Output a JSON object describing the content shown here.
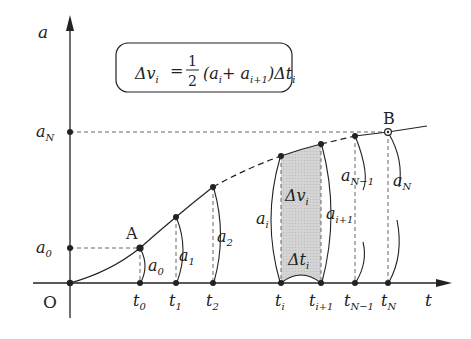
{
  "axes": {
    "y_label": "a",
    "x_label": "t",
    "origin_label": "O"
  },
  "formula": {
    "lhs": "Δv",
    "lhs_sub": "i",
    "equals": "=",
    "frac_num": "1",
    "frac_den": "2",
    "rhs_open": "(a",
    "rhs_sub1": "i",
    "rhs_plus": "+ a",
    "rhs_sub2": "i+1",
    "rhs_close": ")Δt",
    "rhs_sub3": "i"
  },
  "points": {
    "A": "A",
    "B": "B"
  },
  "y_ticks": [
    {
      "main": "a",
      "sub": "N"
    },
    {
      "main": "a",
      "sub": "0"
    }
  ],
  "x_ticks": [
    {
      "main": "t",
      "sub": "0"
    },
    {
      "main": "t",
      "sub": "1"
    },
    {
      "main": "t",
      "sub": "2"
    },
    {
      "main": "t",
      "sub": "i"
    },
    {
      "main": "t",
      "sub": "i+1"
    },
    {
      "main": "t",
      "sub": "N−1"
    },
    {
      "main": "t",
      "sub": "N"
    }
  ],
  "height_labels": [
    {
      "main": "a",
      "sub": "0"
    },
    {
      "main": "a",
      "sub": "1"
    },
    {
      "main": "a",
      "sub": "2"
    },
    {
      "main": "a",
      "sub": "i"
    },
    {
      "main": "a",
      "sub": "i+1"
    },
    {
      "main": "a",
      "sub": "N−1"
    },
    {
      "main": "a",
      "sub": "N"
    }
  ],
  "strip": {
    "area_main": "Δv",
    "area_sub": "i",
    "width_main": "Δt",
    "width_sub": "i",
    "fill": "#cfcfcf"
  },
  "colors": {
    "ink": "#222222",
    "dash": "#555555",
    "background": "#ffffff"
  }
}
